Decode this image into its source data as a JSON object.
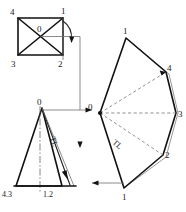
{
  "figure": {
    "background_color": "#ffffff",
    "line_color": "#111111",
    "dash_color": "#777777",
    "ghost_color": "#9a9a9a"
  },
  "top_view": {
    "name": "Top view - square base pyramid",
    "apex_label": "0",
    "corner_labels": {
      "top_left": "4",
      "top_right": "1",
      "bottom_left": "3",
      "bottom_right": "2"
    }
  },
  "front_view": {
    "name": "Front view - triangle elevation",
    "apex_label": "0",
    "base_left_label": "4.3",
    "base_right_label": "1.2",
    "true_length_label": "TL"
  },
  "development": {
    "name": "Developed surface fan",
    "apex_label": "0",
    "true_length_label": "TL",
    "vertex_labels": {
      "top": "1",
      "upper_right": "4",
      "right": "3",
      "lower_right": "2",
      "bottom": "1"
    }
  }
}
